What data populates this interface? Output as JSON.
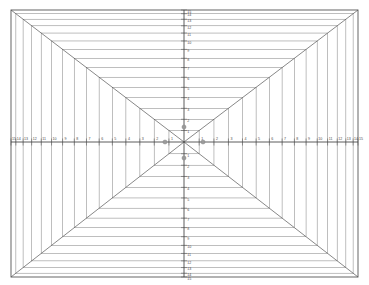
{
  "diagram": {
    "type": "perspective-grid",
    "background_color": "#ffffff",
    "line_color": "#555555",
    "thin_line_color": "#8a8a8a",
    "axis_color": "#4a4a4a",
    "marker_color": "#9a9a9a",
    "label_color": "#4a4a4a",
    "frame": {
      "x": 11,
      "y": 10,
      "width": 347,
      "height": 267
    },
    "vanishing_point": {
      "x": 184,
      "y": 142
    },
    "ring_count": 15,
    "diagonals": 4,
    "axes": {
      "horizontal": {
        "y": 142,
        "x_start": 11,
        "x_end": 358
      },
      "vertical": {
        "x": 184,
        "y_start": 10,
        "y_end": 277
      }
    },
    "x_axis_labels_left": [
      "15",
      "14",
      "13",
      "12",
      "11",
      "10",
      "9",
      "8",
      "7",
      "6",
      "5",
      "4",
      "3",
      "2",
      "1"
    ],
    "x_axis_labels_right": [
      "1",
      "2",
      "3",
      "4",
      "5",
      "6",
      "7",
      "8",
      "9",
      "10",
      "11",
      "12",
      "13",
      "14",
      "15"
    ],
    "y_axis_labels_top": [
      "15",
      "14",
      "13",
      "12",
      "11",
      "10",
      "9",
      "8",
      "7",
      "6",
      "5",
      "4",
      "3",
      "2",
      "1"
    ],
    "y_axis_labels_bottom": [
      "1",
      "2",
      "3",
      "4",
      "5",
      "6",
      "7",
      "8",
      "9",
      "10",
      "11",
      "12",
      "13",
      "14",
      "15"
    ],
    "markers": [
      {
        "name": "marker-up",
        "x": 184,
        "y": 127,
        "label": "2"
      },
      {
        "name": "marker-down",
        "x": 184,
        "y": 158,
        "label": "1"
      },
      {
        "name": "marker-left",
        "x": 165,
        "y": 142,
        "label": "2"
      },
      {
        "name": "marker-right",
        "x": 203,
        "y": 142,
        "label": "2"
      }
    ]
  }
}
